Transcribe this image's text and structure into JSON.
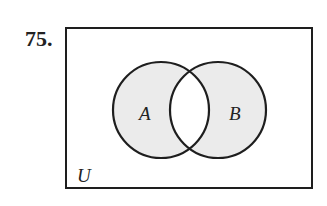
{
  "problem_number": "75.",
  "diagram": {
    "type": "venn",
    "universe_label": "U",
    "sets": [
      {
        "label": "A",
        "cx": 161,
        "cy": 110,
        "r": 48
      },
      {
        "label": "B",
        "cx": 218,
        "cy": 110,
        "r": 48
      }
    ],
    "shaded_region": "symmetric difference (A ∪ B) − (A ∩ B)",
    "colors": {
      "shade": "#ebebeb",
      "stroke": "#1e1e1e",
      "background": "#ffffff"
    }
  }
}
